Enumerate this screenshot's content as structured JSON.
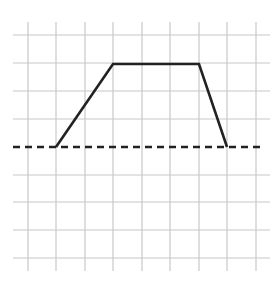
{
  "diagram": {
    "type": "grid-graph",
    "grid": {
      "vertical_lines_x": [
        28,
        56,
        85,
        113,
        142,
        170,
        199,
        227,
        256
      ],
      "horizontal_lines_y": [
        35,
        63,
        91,
        119,
        175,
        202,
        230,
        258
      ],
      "x_extent": [
        13,
        270
      ],
      "y_extent": [
        22,
        271
      ],
      "color": "#c8c8c8"
    },
    "baseline": {
      "style": "dashed",
      "y": 147,
      "x_from": 13,
      "x_to": 265,
      "color": "#222222"
    },
    "shape": {
      "style": "solid",
      "color": "#222222",
      "points": [
        [
          56,
          147
        ],
        [
          113,
          64
        ],
        [
          199,
          64
        ],
        [
          227,
          147
        ]
      ]
    }
  }
}
